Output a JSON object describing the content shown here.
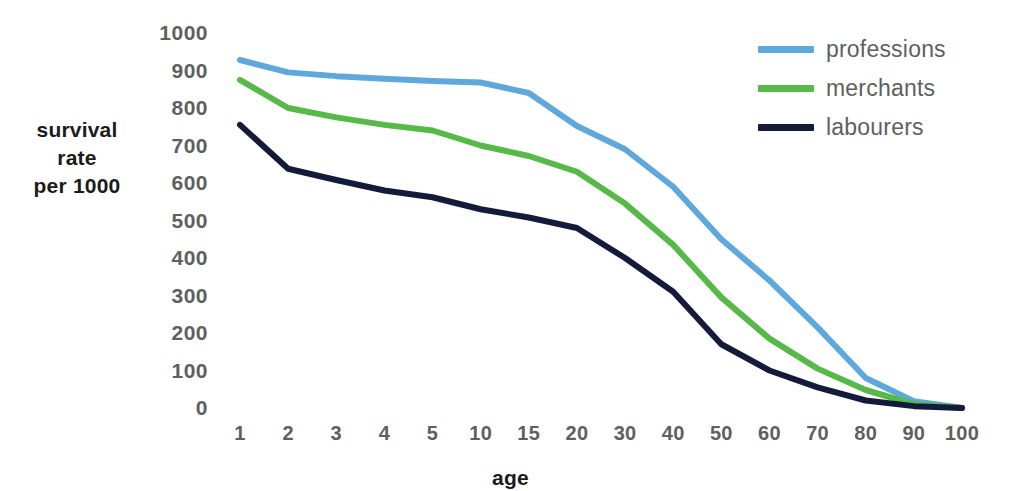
{
  "chart_data": {
    "type": "line",
    "title": "",
    "subtitle": "",
    "xlabel": "age",
    "ylabel": "survival rate per 1000",
    "ylabel_lines": [
      "survival",
      "rate",
      "per 1000"
    ],
    "categories": [
      "1",
      "2",
      "3",
      "4",
      "5",
      "10",
      "15",
      "20",
      "30",
      "40",
      "50",
      "60",
      "70",
      "80",
      "90",
      "100"
    ],
    "ylim": [
      0,
      1000
    ],
    "yticks": [
      1000,
      900,
      800,
      700,
      600,
      500,
      400,
      300,
      200,
      100,
      0
    ],
    "grid": false,
    "legend_position": "top-right",
    "series": [
      {
        "name": "professions",
        "color": "#5FA8DC",
        "values": [
          928,
          895,
          885,
          878,
          872,
          868,
          840,
          752,
          690,
          590,
          450,
          340,
          215,
          80,
          18,
          0
        ]
      },
      {
        "name": "merchants",
        "color": "#56B948",
        "values": [
          875,
          800,
          775,
          755,
          740,
          700,
          672,
          630,
          545,
          435,
          295,
          185,
          105,
          48,
          10,
          0
        ]
      },
      {
        "name": "labourers",
        "color": "#141A3A",
        "values": [
          755,
          638,
          608,
          580,
          562,
          530,
          508,
          480,
          400,
          310,
          170,
          100,
          55,
          20,
          5,
          0
        ]
      }
    ]
  },
  "axis": {
    "y_title_line1": "survival",
    "y_title_line2": "rate",
    "y_title_line3": "per 1000",
    "x_title": "age"
  },
  "colors": {
    "professions": "#5FA8DC",
    "merchants": "#56B948",
    "labourers": "#141A3A",
    "tick_text": "#5f5f5f",
    "axis_title_text": "#1b1b1b",
    "background": "#ffffff"
  }
}
